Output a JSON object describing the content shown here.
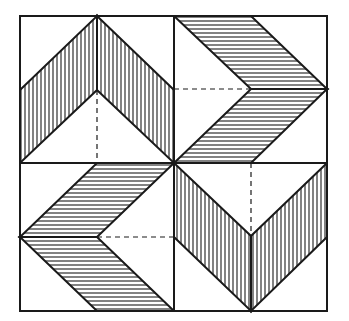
{
  "diagram": {
    "title": "",
    "colors": {
      "ink": "#1a1a1a",
      "background": "#ffffff"
    },
    "frame": {
      "x0": 20,
      "y0": 16,
      "x1": 327,
      "y1": 311,
      "cx": 174,
      "cy": 163
    },
    "hatch_spacing": 4,
    "quadrants": [
      {
        "name": "top-left",
        "hatch": "vertical",
        "bands": [
          [
            [
              20,
              90
            ],
            [
              97,
              16
            ],
            [
              97,
              90
            ],
            [
              20,
              163
            ]
          ],
          [
            [
              97,
              16
            ],
            [
              174,
              90
            ],
            [
              174,
              163
            ],
            [
              97,
              90
            ]
          ]
        ],
        "dashed": [
          [
            97,
            90
          ],
          [
            97,
            163
          ]
        ]
      },
      {
        "name": "top-right",
        "hatch": "horizontal",
        "bands": [
          [
            [
              174,
              16
            ],
            [
              251,
              16
            ],
            [
              327,
              89
            ],
            [
              251,
              89
            ]
          ],
          [
            [
              251,
              89
            ],
            [
              327,
              89
            ],
            [
              251,
              163
            ],
            [
              174,
              163
            ]
          ]
        ],
        "dashed": [
          [
            174,
            89
          ],
          [
            251,
            89
          ]
        ]
      },
      {
        "name": "bottom-left",
        "hatch": "horizontal",
        "bands": [
          [
            [
              97,
              163
            ],
            [
              174,
              163
            ],
            [
              97,
              237
            ],
            [
              20,
              237
            ]
          ],
          [
            [
              20,
              237
            ],
            [
              97,
              237
            ],
            [
              174,
              311
            ],
            [
              97,
              311
            ]
          ]
        ],
        "dashed": [
          [
            97,
            237
          ],
          [
            174,
            237
          ]
        ]
      },
      {
        "name": "bottom-right",
        "hatch": "vertical",
        "bands": [
          [
            [
              174,
              163
            ],
            [
              251,
              236
            ],
            [
              251,
              311
            ],
            [
              174,
              237
            ]
          ],
          [
            [
              327,
              163
            ],
            [
              251,
              236
            ],
            [
              251,
              311
            ],
            [
              327,
              237
            ]
          ]
        ],
        "dashed": [
          [
            251,
            163
          ],
          [
            251,
            236
          ]
        ]
      }
    ]
  }
}
